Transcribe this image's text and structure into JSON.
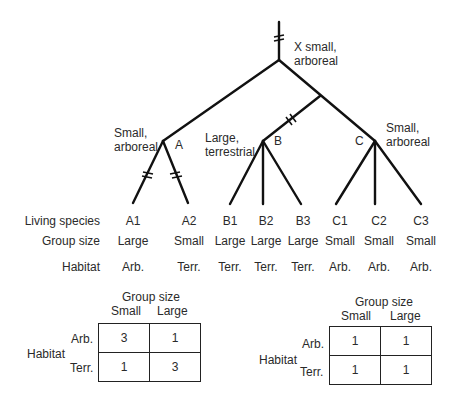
{
  "tree": {
    "root_label": [
      "X small,",
      "arboreal"
    ],
    "clades": [
      {
        "name": "A",
        "label": [
          "Small,",
          "arboreal"
        ]
      },
      {
        "name": "B",
        "label": [
          "Large,",
          "terrestrial"
        ]
      },
      {
        "name": "C",
        "label": [
          "Small,",
          "arboreal"
        ]
      }
    ]
  },
  "rows": {
    "species_label": "Living species",
    "group_label": "Group size",
    "habitat_label": "Habitat"
  },
  "species": [
    {
      "name": "A1",
      "group": "Large",
      "habitat": "Arb."
    },
    {
      "name": "A2",
      "group": "Small",
      "habitat": "Terr."
    },
    {
      "name": "B1",
      "group": "Large",
      "habitat": "Terr."
    },
    {
      "name": "B2",
      "group": "Large",
      "habitat": "Terr."
    },
    {
      "name": "B3",
      "group": "Large",
      "habitat": "Terr."
    },
    {
      "name": "C1",
      "group": "Small",
      "habitat": "Arb."
    },
    {
      "name": "C2",
      "group": "Small",
      "habitat": "Arb."
    },
    {
      "name": "C3",
      "group": "Small",
      "habitat": "Arb."
    }
  ],
  "tables": [
    {
      "title": "Group size",
      "cols": [
        "Small",
        "Large"
      ],
      "row_title": "Habitat",
      "rows": [
        "Arb.",
        "Terr."
      ],
      "values": [
        [
          "3",
          "1"
        ],
        [
          "1",
          "3"
        ]
      ]
    },
    {
      "title": "Group size",
      "cols": [
        "Small",
        "Large"
      ],
      "row_title": "Habitat",
      "rows": [
        "Arb.",
        "Terr."
      ],
      "values": [
        [
          "1",
          "1"
        ],
        [
          "1",
          "1"
        ]
      ]
    }
  ]
}
